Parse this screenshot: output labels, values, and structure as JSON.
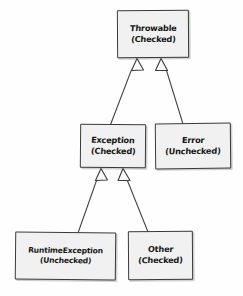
{
  "diagram": {
    "style": "hand-drawn-uml-class-diagram",
    "background_color": "#fefefe",
    "box_fill_color": "#f1f1f1",
    "box_border_color": "#3a3a3a",
    "connector_color": "#4a4a4a",
    "nodes": [
      {
        "id": "throwable",
        "name": "Throwable",
        "kind": "(Checked)",
        "x": 117,
        "y": 10,
        "w": 72,
        "h": 48
      },
      {
        "id": "exception",
        "name": "Exception",
        "kind": "(Checked)",
        "x": 80,
        "y": 124,
        "w": 66,
        "h": 44
      },
      {
        "id": "error",
        "name": "Error",
        "kind": "(Unchecked)",
        "x": 155,
        "y": 123,
        "w": 76,
        "h": 46
      },
      {
        "id": "runtimeexception",
        "name": "RuntimeException",
        "kind": "(Unchecked)",
        "x": 15,
        "y": 232,
        "w": 101,
        "h": 48
      },
      {
        "id": "other",
        "name": "Other",
        "kind": "(Checked)",
        "x": 128,
        "y": 231,
        "w": 65,
        "h": 49
      }
    ],
    "edges": [
      {
        "from": "exception",
        "to": "throwable",
        "type": "generalization",
        "arrow": "hollow-triangle"
      },
      {
        "from": "error",
        "to": "throwable",
        "type": "generalization",
        "arrow": "hollow-triangle"
      },
      {
        "from": "runtimeexception",
        "to": "exception",
        "type": "generalization",
        "arrow": "hollow-triangle"
      },
      {
        "from": "other",
        "to": "exception",
        "type": "generalization",
        "arrow": "hollow-triangle"
      }
    ]
  }
}
